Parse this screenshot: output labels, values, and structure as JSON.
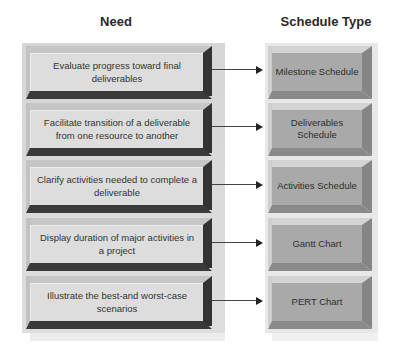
{
  "headers": {
    "need": "Need",
    "schedule_type": "Schedule Type"
  },
  "rows": [
    {
      "need": "Evaluate progress toward final deliverables",
      "schedule_type": "Milestone Schedule"
    },
    {
      "need": "Facilitate transition of a deliverable from one resource to another",
      "schedule_type": "Deliverables Schedule"
    },
    {
      "need": "Clarify activities needed to complete a deliverable",
      "schedule_type": "Activities Schedule"
    },
    {
      "need": "Display duration of major activities in a project",
      "schedule_type": "Gantt Chart"
    },
    {
      "need": "Illustrate the best-and worst-case scenarios",
      "schedule_type": "PERT Chart"
    }
  ],
  "colors": {
    "need_face": "#dddddd",
    "need_bevel_dark": "#333333",
    "type_face": "#a9a9a9",
    "type_bevel_dark": "#858585",
    "arrow": "#222222"
  }
}
